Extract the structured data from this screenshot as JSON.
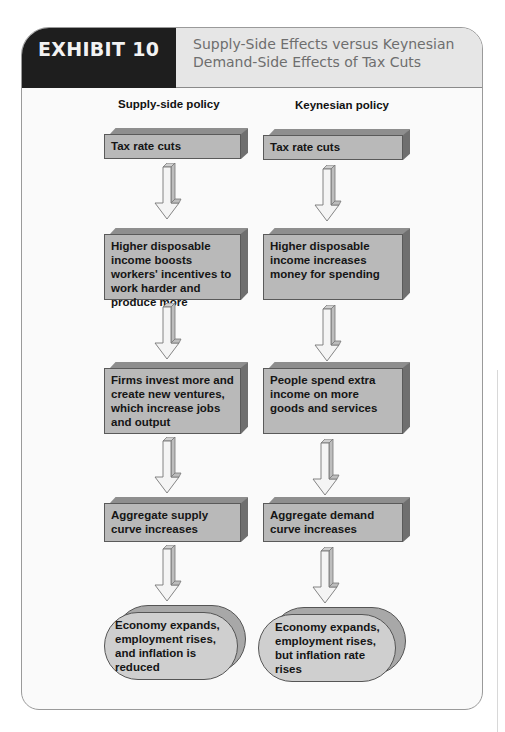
{
  "header": {
    "exhibit_label": "EXHIBIT 10",
    "title": "Supply-Side Effects versus Keynesian Demand-Side Effects of Tax Cuts"
  },
  "columns": [
    {
      "label": "Supply-side policy",
      "steps": [
        "Tax rate cuts",
        "Higher disposable income boosts workers' incentives to work harder and produce more",
        "Firms invest more and create new ventures, which increase jobs and output",
        "Aggregate supply curve increases"
      ],
      "outcome": "Economy expands, employment rises, and inflation is reduced"
    },
    {
      "label": "Keynesian policy",
      "steps": [
        "Tax rate cuts",
        "Higher disposable income increases money for spending",
        "People spend extra income on more goods and services",
        "Aggregate demand curve increases"
      ],
      "outcome": "Economy expands, employment rises, but inflation rate rises"
    }
  ],
  "colors": {
    "header_dark": "#1e1e1e",
    "header_light": "#e6e6e6",
    "box_face": "#b9b9b9",
    "box_top": "#8e8e8e",
    "box_side": "#6f6f6f",
    "oval_face": "#cfcfcf",
    "arrow_fill": "#f4f4f4"
  }
}
